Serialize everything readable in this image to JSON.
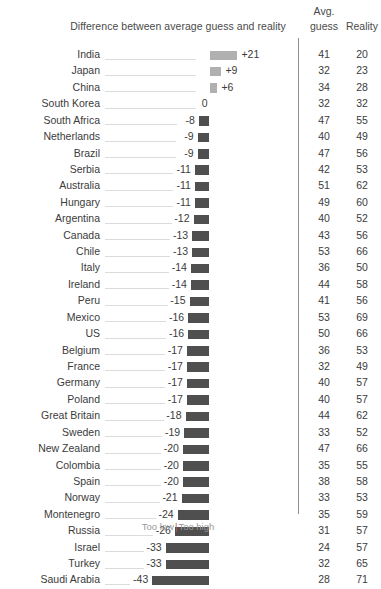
{
  "header": {
    "chart_title": "Difference between average guess and reality",
    "avg_label_line1": "Avg.",
    "avg_label_line2": "guess",
    "reality_label": "Reality"
  },
  "legend": {
    "too_low": "Too low",
    "separator": "|",
    "too_high": "Too high"
  },
  "colors": {
    "bar_negative": "#4f4f4f",
    "bar_positive": "#b0b0b0",
    "leader_line": "#dcdcdc",
    "divider": "#8f8f8f",
    "text": "#3b3b3b",
    "legend_separator": "#c9543f"
  },
  "chart_data": {
    "type": "bar",
    "title": "Difference between average guess and reality",
    "xlabel": "",
    "ylabel": "",
    "orientation": "horizontal",
    "grid": false,
    "zero_baseline": true,
    "legend_position": "bottom",
    "legend_entries": [
      "Too low",
      "Too high"
    ],
    "xlim": [
      -43,
      21
    ],
    "categories": [
      "India",
      "Japan",
      "China",
      "South Korea",
      "South Africa",
      "Netherlands",
      "Brazil",
      "Serbia",
      "Australia",
      "Hungary",
      "Argentina",
      "Canada",
      "Chile",
      "Italy",
      "Ireland",
      "Peru",
      "Mexico",
      "US",
      "Belgium",
      "France",
      "Germany",
      "Poland",
      "Great Britain",
      "Sweden",
      "New Zealand",
      "Colombia",
      "Spain",
      "Norway",
      "Montenegro",
      "Russia",
      "Israel",
      "Turkey",
      "Saudi Arabia"
    ],
    "values": [
      21,
      9,
      6,
      0,
      -8,
      -9,
      -9,
      -11,
      -11,
      -11,
      -12,
      -13,
      -13,
      -14,
      -14,
      -15,
      -16,
      -16,
      -17,
      -17,
      -17,
      -17,
      -18,
      -19,
      -20,
      -20,
      -20,
      -21,
      -24,
      -26,
      -33,
      -33,
      -43
    ],
    "value_labels": [
      "+21",
      "+9",
      "+6",
      "0",
      "-8",
      "-9",
      "-9",
      "-11",
      "-11",
      "-11",
      "-12",
      "-13",
      "-13",
      "-14",
      "-14",
      "-15",
      "-16",
      "-16",
      "-17",
      "-17",
      "-17",
      "-17",
      "-18",
      "-19",
      "-20",
      "-20",
      "-20",
      "-21",
      "-24",
      "-26",
      "-33",
      "-33",
      "-43"
    ],
    "series": [
      {
        "name": "Avg. guess",
        "values": [
          41,
          32,
          34,
          32,
          47,
          40,
          47,
          42,
          51,
          49,
          40,
          43,
          53,
          36,
          44,
          41,
          53,
          50,
          36,
          32,
          40,
          40,
          44,
          33,
          47,
          35,
          38,
          33,
          35,
          31,
          24,
          32,
          28
        ]
      },
      {
        "name": "Reality",
        "values": [
          20,
          23,
          28,
          32,
          55,
          49,
          56,
          53,
          62,
          60,
          52,
          56,
          66,
          50,
          58,
          56,
          69,
          66,
          53,
          49,
          57,
          57,
          62,
          52,
          66,
          55,
          58,
          53,
          59,
          57,
          57,
          65,
          71
        ]
      }
    ]
  },
  "rows": [
    {
      "country": "India",
      "diff": 21,
      "label": "+21",
      "guess": "41",
      "reality": "20"
    },
    {
      "country": "Japan",
      "diff": 9,
      "label": "+9",
      "guess": "32",
      "reality": "23"
    },
    {
      "country": "China",
      "diff": 6,
      "label": "+6",
      "guess": "34",
      "reality": "28"
    },
    {
      "country": "South Korea",
      "diff": 0,
      "label": "0",
      "guess": "32",
      "reality": "32"
    },
    {
      "country": "South Africa",
      "diff": -8,
      "label": "-8",
      "guess": "47",
      "reality": "55"
    },
    {
      "country": "Netherlands",
      "diff": -9,
      "label": "-9",
      "guess": "40",
      "reality": "49"
    },
    {
      "country": "Brazil",
      "diff": -9,
      "label": "-9",
      "guess": "47",
      "reality": "56"
    },
    {
      "country": "Serbia",
      "diff": -11,
      "label": "-11",
      "guess": "42",
      "reality": "53"
    },
    {
      "country": "Australia",
      "diff": -11,
      "label": "-11",
      "guess": "51",
      "reality": "62"
    },
    {
      "country": "Hungary",
      "diff": -11,
      "label": "-11",
      "guess": "49",
      "reality": "60"
    },
    {
      "country": "Argentina",
      "diff": -12,
      "label": "-12",
      "guess": "40",
      "reality": "52"
    },
    {
      "country": "Canada",
      "diff": -13,
      "label": "-13",
      "guess": "43",
      "reality": "56"
    },
    {
      "country": "Chile",
      "diff": -13,
      "label": "-13",
      "guess": "53",
      "reality": "66"
    },
    {
      "country": "Italy",
      "diff": -14,
      "label": "-14",
      "guess": "36",
      "reality": "50"
    },
    {
      "country": "Ireland",
      "diff": -14,
      "label": "-14",
      "guess": "44",
      "reality": "58"
    },
    {
      "country": "Peru",
      "diff": -15,
      "label": "-15",
      "guess": "41",
      "reality": "56"
    },
    {
      "country": "Mexico",
      "diff": -16,
      "label": "-16",
      "guess": "53",
      "reality": "69"
    },
    {
      "country": "US",
      "diff": -16,
      "label": "-16",
      "guess": "50",
      "reality": "66"
    },
    {
      "country": "Belgium",
      "diff": -17,
      "label": "-17",
      "guess": "36",
      "reality": "53"
    },
    {
      "country": "France",
      "diff": -17,
      "label": "-17",
      "guess": "32",
      "reality": "49"
    },
    {
      "country": "Germany",
      "diff": -17,
      "label": "-17",
      "guess": "40",
      "reality": "57"
    },
    {
      "country": "Poland",
      "diff": -17,
      "label": "-17",
      "guess": "40",
      "reality": "57"
    },
    {
      "country": "Great Britain",
      "diff": -18,
      "label": "-18",
      "guess": "44",
      "reality": "62"
    },
    {
      "country": "Sweden",
      "diff": -19,
      "label": "-19",
      "guess": "33",
      "reality": "52"
    },
    {
      "country": "New Zealand",
      "diff": -20,
      "label": "-20",
      "guess": "47",
      "reality": "66"
    },
    {
      "country": "Colombia",
      "diff": -20,
      "label": "-20",
      "guess": "35",
      "reality": "55"
    },
    {
      "country": "Spain",
      "diff": -20,
      "label": "-20",
      "guess": "38",
      "reality": "58"
    },
    {
      "country": "Norway",
      "diff": -21,
      "label": "-21",
      "guess": "33",
      "reality": "53"
    },
    {
      "country": "Montenegro",
      "diff": -24,
      "label": "-24",
      "guess": "35",
      "reality": "59"
    },
    {
      "country": "Russia",
      "diff": -26,
      "label": "-26",
      "guess": "31",
      "reality": "57"
    },
    {
      "country": "Israel",
      "diff": -33,
      "label": "-33",
      "guess": "24",
      "reality": "57"
    },
    {
      "country": "Turkey",
      "diff": -33,
      "label": "-33",
      "guess": "32",
      "reality": "65"
    },
    {
      "country": "Saudi Arabia",
      "diff": -43,
      "label": "-43",
      "guess": "28",
      "reality": "71"
    }
  ]
}
